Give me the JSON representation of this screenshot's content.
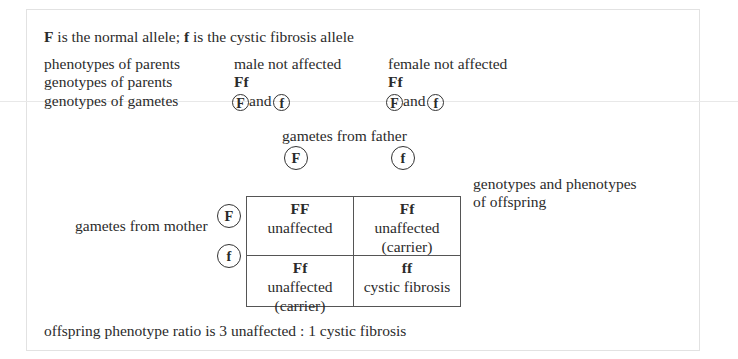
{
  "intro": {
    "allele_normal": "F",
    "allele_normal_text": " is the normal allele; ",
    "allele_cf": "f",
    "allele_cf_text": " is the cystic fibrosis allele"
  },
  "rows": {
    "phenotypes_label": "phenotypes of parents",
    "genotypes_label": "genotypes of parents",
    "gametes_label": "genotypes of gametes"
  },
  "male": {
    "phenotype": "male not affected",
    "genotype": "Ff",
    "gamete1": "F",
    "and": "and",
    "gamete2": "f"
  },
  "female": {
    "phenotype": "female not affected",
    "genotype": "Ff",
    "gamete1": "F",
    "and": "and",
    "gamete2": "f"
  },
  "punnett": {
    "father_label": "gametes from father",
    "mother_label": "gametes from mother",
    "father_gametes": [
      "F",
      "f"
    ],
    "mother_gametes": [
      "F",
      "f"
    ],
    "offspring_label_line1": "genotypes and phenotypes",
    "offspring_label_line2": "of offspring",
    "cells": [
      {
        "genotype": "FF",
        "phenotype": "unaffected",
        "note": ""
      },
      {
        "genotype": "Ff",
        "phenotype": "unaffected",
        "note": "(carrier)"
      },
      {
        "genotype": "Ff",
        "phenotype": "unaffected",
        "note": "(carrier)"
      },
      {
        "genotype": "ff",
        "phenotype": "cystic fibrosis",
        "note": ""
      }
    ]
  },
  "ratio": "offspring phenotype ratio is 3 unaffected : 1 cystic fibrosis"
}
